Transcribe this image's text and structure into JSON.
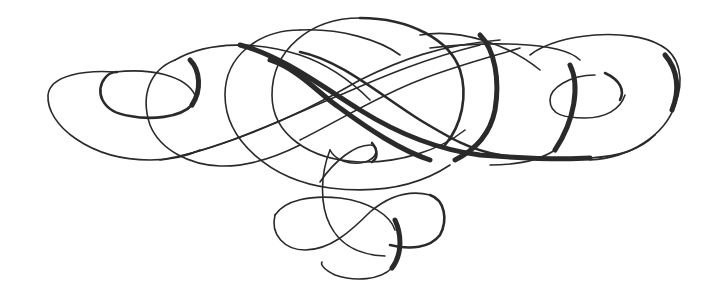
{
  "image": {
    "description": "Decorative calligraphic flourish ornament",
    "ink_color": "#2a2a2a",
    "background_color": "#ffffff"
  }
}
